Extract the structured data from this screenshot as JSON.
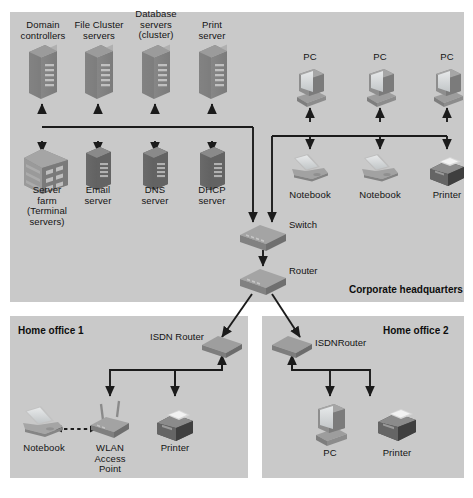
{
  "diagram": {
    "background_color": "#ffffff",
    "panel_color": "#c9c9c9",
    "line_color": "#1b1b1b",
    "zones": [
      {
        "name": "corporate-headquarters",
        "label": "Corporate headquarters"
      },
      {
        "name": "home-office-1",
        "label": "Home office 1"
      },
      {
        "name": "home-office-2",
        "label": "Home office 2"
      }
    ],
    "nodes": {
      "domain_controllers": "Domain\ncontrollers",
      "file_cluster_servers": "File Cluster\nservers",
      "database_servers": "Database\nservers\n(cluster)",
      "print_server": "Print\nserver",
      "pc_1": "PC",
      "pc_2": "PC",
      "pc_3": "PC",
      "server_farm": "Server\nfarm\n(Terminal\nservers)",
      "email_server": "Email\nserver",
      "dns_server": "DNS\nserver",
      "dhcp_server": "DHCP\nserver",
      "notebook_hq_1": "Notebook",
      "notebook_hq_2": "Notebook",
      "printer_hq": "Printer",
      "switch": "Switch",
      "router": "Router",
      "isdn_router_1": "ISDN Router",
      "isdn_router_2": "ISDNRouter",
      "notebook_ho1": "Notebook",
      "wlan_access_point": "WLAN\nAccess\nPoint",
      "printer_ho1": "Printer",
      "pc_ho2": "PC",
      "printer_ho2": "Printer"
    }
  }
}
